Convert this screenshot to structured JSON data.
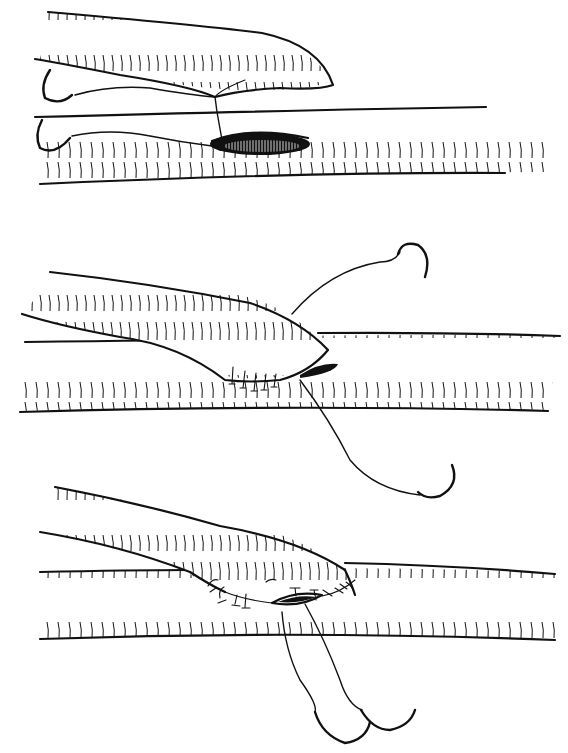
{
  "figure": {
    "background": "#ffffff",
    "ink": "#111111",
    "panels": [
      {
        "id": "step-1",
        "name": "graft-positioned-over-arteriotomy",
        "host_vessel": {
          "top": [
            [
              45,
              117
            ],
            [
              300,
              110
            ],
            [
              545,
              107
            ]
          ],
          "bottom": [
            [
              40,
              183
            ],
            [
              300,
              173
            ],
            [
              545,
              172
            ]
          ]
        },
        "graft": {
          "tip": [
            335,
            85
          ]
        },
        "arteriotomy": {
          "cx": 283,
          "cy": 145,
          "rx": 55,
          "ry": 12
        },
        "needles": 2
      },
      {
        "id": "step-2",
        "name": "heel-sutured-toe-open",
        "host_vessel": {
          "top": [
            [
              25,
              342
            ],
            [
              300,
              333
            ],
            [
              560,
              335
            ]
          ],
          "bottom": [
            [
              20,
              411
            ],
            [
              300,
              405
            ],
            [
              548,
              410
            ]
          ]
        },
        "graft": {
          "tip": [
            333,
            365
          ]
        },
        "sutures_interrupted": 5,
        "needles": 2
      },
      {
        "id": "step-3",
        "name": "anastomosis-nearly-complete",
        "host_vessel": {
          "top": [
            [
              42,
              573
            ],
            [
              320,
              563
            ],
            [
              555,
              573
            ]
          ],
          "bottom": [
            [
              40,
              638
            ],
            [
              300,
              632
            ],
            [
              555,
              640
            ]
          ]
        },
        "graft": {
          "tip": [
            355,
            595
          ]
        },
        "sutures_interrupted": 10,
        "needles": 2
      }
    ]
  }
}
